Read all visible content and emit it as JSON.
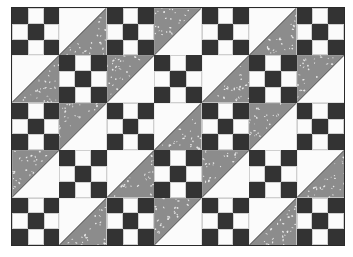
{
  "quilt": {
    "title": "",
    "rows": 5,
    "cols": 7,
    "colors": {
      "dark": "#333333",
      "light": "#fbfbfb",
      "print": "#8c8c8c",
      "print_fleck": "#e6e6e6",
      "seam": "#1e1e1e"
    },
    "blocks": [
      [
        "nine-patch",
        "hst-white-top-left",
        "nine-patch",
        "hst-gray-top-left",
        "nine-patch",
        "hst-white-top-left",
        "nine-patch"
      ],
      [
        "hst-white-top-left",
        "nine-patch",
        "hst-gray-top-left",
        "nine-patch",
        "hst-white-top-left",
        "nine-patch",
        "hst-gray-top-left"
      ],
      [
        "nine-patch",
        "hst-gray-top-left",
        "nine-patch",
        "hst-white-top-left",
        "nine-patch",
        "hst-gray-top-left",
        "nine-patch"
      ],
      [
        "hst-gray-top-left",
        "nine-patch",
        "hst-white-top-left",
        "nine-patch",
        "hst-gray-top-left",
        "nine-patch",
        "hst-white-top-left"
      ],
      [
        "nine-patch",
        "hst-white-top-left",
        "nine-patch",
        "hst-gray-top-left",
        "nine-patch",
        "hst-white-top-left",
        "nine-patch"
      ]
    ],
    "nine_patch_pattern": [
      "d",
      "l",
      "d",
      "l",
      "d",
      "l",
      "d",
      "l",
      "d"
    ]
  }
}
